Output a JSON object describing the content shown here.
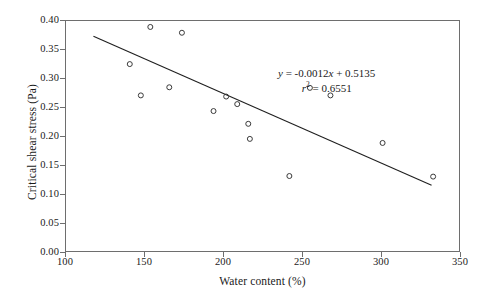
{
  "chart_data": {
    "type": "scatter",
    "title": "",
    "xlabel": "Water content (%)",
    "ylabel": "Critical shear stress (Pa)",
    "xlim": [
      100,
      350
    ],
    "ylim": [
      0.0,
      0.4
    ],
    "grid": false,
    "legend": null,
    "x_ticks": [
      "100",
      "150",
      "200",
      "250",
      "300",
      "350"
    ],
    "y_ticks": [
      "0.00",
      "0.05",
      "0.10",
      "0.15",
      "0.20",
      "0.25",
      "0.30",
      "0.35",
      "0.40"
    ],
    "marker": "open-circle",
    "points": [
      {
        "x": 141,
        "y": 0.324
      },
      {
        "x": 148,
        "y": 0.27
      },
      {
        "x": 154,
        "y": 0.388
      },
      {
        "x": 166,
        "y": 0.284
      },
      {
        "x": 174,
        "y": 0.378
      },
      {
        "x": 194,
        "y": 0.243
      },
      {
        "x": 202,
        "y": 0.268
      },
      {
        "x": 209,
        "y": 0.255
      },
      {
        "x": 216,
        "y": 0.221
      },
      {
        "x": 217,
        "y": 0.195
      },
      {
        "x": 242,
        "y": 0.131
      },
      {
        "x": 255,
        "y": 0.283
      },
      {
        "x": 268,
        "y": 0.27
      },
      {
        "x": 301,
        "y": 0.188
      },
      {
        "x": 333,
        "y": 0.13
      }
    ],
    "trendline": {
      "type": "linear",
      "slope": -0.0012,
      "intercept": 0.5135,
      "r_squared": 0.6551,
      "x_start": 118,
      "x_end": 332,
      "equation_label": "y = -0.0012x + 0.5135",
      "r2_label": "r 2 = 0.6551"
    },
    "annotation": {
      "equation_prefix_var": "y",
      "equation_rest": " = -0.0012",
      "equation_x_var": "x",
      "equation_tail": " + 0.5135",
      "r2_var": "r",
      "r2_exp": "2",
      "r2_rest": " = 0.6551"
    }
  },
  "colors": {
    "axis": "#6e6e6e",
    "marker_stroke": "#3a3a3a",
    "trendline": "#1f1f1f",
    "text": "#1a1a1a",
    "background": "#ffffff"
  }
}
